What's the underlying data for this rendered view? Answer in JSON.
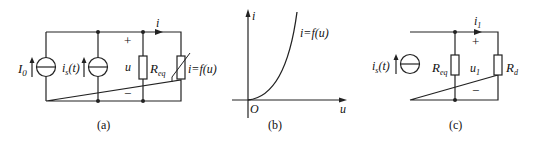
{
  "figure_a": {
    "caption": "(a)",
    "source1_label": "I",
    "source1_sub": "0",
    "source2_label": "i",
    "source2_sub": "s",
    "source2_arg": "(t)",
    "voltage_label": "u",
    "plus": "+",
    "minus": "−",
    "resistor_label": "R",
    "resistor_sub": "eq",
    "current_label": "i",
    "nonlinear_label": "i=f(u)"
  },
  "figure_b": {
    "caption": "(b)",
    "y_axis_label": "i",
    "x_axis_label": "u",
    "origin_label": "O",
    "curve_label": "i=f(u)"
  },
  "figure_c": {
    "caption": "(c)",
    "source_label": "i",
    "source_sub": "s",
    "source_arg": "(t)",
    "resistor1_label": "R",
    "resistor1_sub": "eq",
    "voltage_label": "u",
    "voltage_sub": "1",
    "plus": "+",
    "minus": "−",
    "current_label": "i",
    "current_sub": "1",
    "resistor2_label": "R",
    "resistor2_sub": "d"
  }
}
